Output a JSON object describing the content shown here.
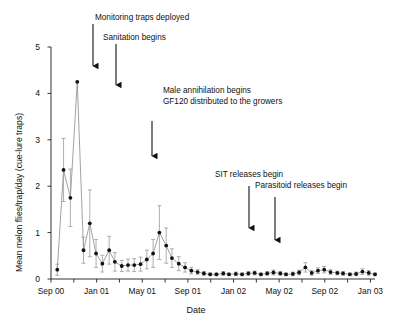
{
  "chart_data": {
    "type": "line",
    "title": "",
    "xlabel": "Date",
    "ylabel": "Mean melon flies/trap/day (cue-lure traps)",
    "ylim": [
      0,
      5
    ],
    "yticks": [
      0,
      1,
      2,
      3,
      4,
      5
    ],
    "yticklabels": [
      "0",
      "1",
      "2",
      "3",
      "4",
      "5"
    ],
    "xlim": [
      "Sep 00",
      "Jan 03"
    ],
    "xticks": [
      0,
      4,
      8,
      12,
      16,
      20,
      24,
      28
    ],
    "xticklabels": [
      "Sep 00",
      "Jan 01",
      "May 01",
      "Sep 01",
      "Jan 02",
      "May 02",
      "Sep 02",
      "Jan 03"
    ],
    "xtick_minor_interval_months": 2,
    "grid": false,
    "legend": null,
    "marker": "filled-circle",
    "errorbars": "standard-error",
    "series": [
      {
        "name": "Mean melon flies per trap per day",
        "x_months_from_sep00": [
          0.55,
          1.1,
          1.7,
          2.3,
          2.85,
          3.4,
          3.95,
          4.5,
          5.1,
          5.6,
          6.2,
          6.75,
          7.3,
          7.85,
          8.4,
          8.95,
          9.5,
          10.1,
          10.6,
          11.2,
          11.75,
          12.3,
          12.85,
          13.4,
          13.95,
          14.5,
          15.1,
          15.6,
          16.2,
          16.75,
          17.3,
          17.85,
          18.4,
          18.95,
          19.5,
          20.1,
          20.6,
          21.2,
          21.75,
          22.3,
          22.85,
          23.4,
          23.95,
          24.5,
          25.1,
          25.6,
          26.2,
          26.75,
          27.3,
          27.85,
          28.4
        ],
        "values": [
          0.2,
          2.35,
          1.75,
          4.25,
          0.62,
          1.2,
          0.55,
          0.33,
          0.62,
          0.37,
          0.28,
          0.3,
          0.3,
          0.32,
          0.42,
          0.55,
          1.0,
          0.72,
          0.45,
          0.33,
          0.25,
          0.18,
          0.15,
          0.12,
          0.1,
          0.1,
          0.12,
          0.1,
          0.11,
          0.1,
          0.12,
          0.13,
          0.1,
          0.12,
          0.14,
          0.12,
          0.1,
          0.11,
          0.14,
          0.25,
          0.13,
          0.18,
          0.2,
          0.15,
          0.13,
          0.12,
          0.1,
          0.11,
          0.16,
          0.13,
          0.1
        ],
        "errors": [
          0.12,
          0.68,
          0.62,
          0.0,
          0.28,
          0.72,
          0.3,
          0.18,
          0.3,
          0.2,
          0.12,
          0.13,
          0.14,
          0.15,
          0.2,
          0.3,
          0.58,
          0.38,
          0.2,
          0.15,
          0.1,
          0.07,
          0.05,
          0.04,
          0.03,
          0.03,
          0.04,
          0.03,
          0.04,
          0.03,
          0.04,
          0.04,
          0.03,
          0.04,
          0.05,
          0.04,
          0.03,
          0.04,
          0.05,
          0.1,
          0.05,
          0.06,
          0.07,
          0.05,
          0.04,
          0.04,
          0.03,
          0.04,
          0.06,
          0.05,
          0.03
        ]
      }
    ],
    "annotations": [
      {
        "id": "monitoring-traps",
        "label": "Monitoring traps deployed",
        "text_x": 95,
        "text_y": 13,
        "arrow_x": 93,
        "arrow_y1": 24,
        "arrow_y2": 72
      },
      {
        "id": "sanitation",
        "label": "Sanitation begins",
        "text_x": 103,
        "text_y": 33,
        "arrow_x": 116,
        "arrow_y1": 44,
        "arrow_y2": 91
      },
      {
        "id": "male-annihilation",
        "label": "Male annihilation begins",
        "text_x": 163,
        "text_y": 86,
        "arrow_x": 152,
        "arrow_y1": 121,
        "arrow_y2": 162
      },
      {
        "id": "gf120",
        "label": "GF120 distributed to the growers",
        "text_x": 163,
        "text_y": 97,
        "arrow_x": null,
        "arrow_y1": null,
        "arrow_y2": null
      },
      {
        "id": "sit-releases",
        "label": "SIT releases begin",
        "text_x": 215,
        "text_y": 170,
        "arrow_x": 249,
        "arrow_y1": 186,
        "arrow_y2": 234
      },
      {
        "id": "parasitoid-releases",
        "label": "Parasitoid releases begin",
        "text_x": 255,
        "text_y": 181,
        "arrow_x": 275,
        "arrow_y1": 197,
        "arrow_y2": 246
      }
    ]
  },
  "colors": {
    "axis": "#333333",
    "marker": "#111111",
    "line": "#8a8a8a",
    "errorbar": "#9a9a9a",
    "text": "#111111",
    "background": "#ffffff"
  }
}
